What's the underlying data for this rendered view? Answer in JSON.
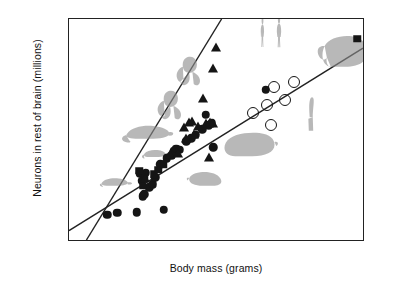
{
  "figure": {
    "domain": "chart",
    "background_color": "#ffffff",
    "marker_color": "#151515",
    "line_color": "#222222"
  },
  "chart_data": {
    "type": "scatter",
    "title": "",
    "xlabel": "Body mass (grams)",
    "ylabel": "Neurons in rest of brain (millions)",
    "xscale": "log",
    "yscale": "log",
    "xlim": [
      1,
      10000000
    ],
    "ylim": [
      2,
      1000
    ],
    "grid": false,
    "legend_position": "none",
    "xticks": [
      {
        "value": 1,
        "label": "1"
      },
      {
        "value": 10,
        "label": "10"
      },
      {
        "value": 100,
        "label": "100"
      },
      {
        "value": 1000,
        "label": "1,000"
      },
      {
        "value": 10000,
        "label": ""
      },
      {
        "value": 100000,
        "label": "100,000"
      },
      {
        "value": 1000000,
        "label": ""
      },
      {
        "value": 10000000,
        "label": "10,000,000"
      }
    ],
    "yticks": [
      {
        "value": 2,
        "label": "2"
      },
      {
        "value": 10,
        "label": "10"
      },
      {
        "value": 40,
        "label": "40"
      },
      {
        "value": 100,
        "label": "100"
      },
      {
        "value": 400,
        "label": "400"
      },
      {
        "value": 1000,
        "label": "1,000"
      }
    ],
    "series": [
      {
        "name": "Rodents (filled circles)",
        "marker": "circle",
        "filled": true,
        "points": [
          [
            8,
            4.3
          ],
          [
            14,
            4.5
          ],
          [
            40,
            4.6
          ],
          [
            47,
            13.5
          ],
          [
            52,
            11.0
          ],
          [
            55,
            7.2
          ],
          [
            60,
            7.6
          ],
          [
            66,
            13.8
          ],
          [
            78,
            9.2
          ],
          [
            95,
            10.0
          ],
          [
            110,
            12.2
          ],
          [
            145,
            17.5
          ],
          [
            175,
            4.9
          ],
          [
            205,
            20.5
          ],
          [
            260,
            22.0
          ],
          [
            300,
            25.5
          ],
          [
            340,
            27.0
          ],
          [
            420,
            26.0
          ],
          [
            600,
            33.0
          ],
          [
            780,
            36.0
          ],
          [
            1000,
            40.0
          ],
          [
            1400,
            46.0
          ],
          [
            1700,
            69.0
          ],
          [
            2000,
            52.0
          ],
          [
            2400,
            55.0
          ],
          [
            2600,
            28.0
          ],
          [
            45000,
            140.0
          ]
        ]
      },
      {
        "name": "Insectivores / other (filled squares)",
        "marker": "square",
        "filled": true,
        "points": [
          [
            46,
            14.5
          ],
          [
            56,
            9.6
          ],
          [
            62,
            12.0
          ],
          [
            100,
            13.2
          ],
          [
            130,
            15.0
          ],
          [
            170,
            17.5
          ],
          [
            6500000,
            580.0
          ]
        ]
      },
      {
        "name": "Primates (filled triangles)",
        "marker": "triangle",
        "filled": true,
        "points": [
          [
            62,
            12.8
          ],
          [
            250,
            25.0
          ],
          [
            380,
            26.0
          ],
          [
            520,
            54.0
          ],
          [
            600,
            40.0
          ],
          [
            700,
            62.0
          ],
          [
            820,
            64.0
          ],
          [
            900,
            44.0
          ],
          [
            1100,
            55.0
          ],
          [
            1500,
            120.0
          ],
          [
            1700,
            60.0
          ],
          [
            2000,
            23.0
          ],
          [
            2200,
            62.0
          ],
          [
            2500,
            60.0
          ],
          [
            2600,
            280.0
          ],
          [
            3000,
            500.0
          ]
        ]
      },
      {
        "name": "Artiodactyls (open circles)",
        "marker": "circle",
        "filled": false,
        "points": [
          [
            23000,
            72.0
          ],
          [
            48000,
            90.0
          ],
          [
            60000,
            52.0
          ],
          [
            72000,
            150.0
          ],
          [
            130000,
            105.0
          ],
          [
            210000,
            175.0
          ]
        ]
      }
    ],
    "trendlines": [
      {
        "name": "Non-primate (shallow) regression",
        "p1": [
          1,
          2.6
        ],
        "p2": [
          10000000,
          440.0
        ]
      },
      {
        "name": "Primate (steep) regression",
        "p1": [
          2.6,
          2.0
        ],
        "p2": [
          4300,
          1000.0
        ]
      }
    ],
    "annotations": [
      {
        "name": "human-figures",
        "label": "humans",
        "x": 62000,
        "y": 700
      },
      {
        "name": "elephant",
        "label": "elephant",
        "x": 3000000,
        "y": 420
      },
      {
        "name": "giraffe",
        "label": "giraffe",
        "x": 520000,
        "y": 70
      },
      {
        "name": "capybara",
        "label": "capybara",
        "x": 18000,
        "y": 31
      },
      {
        "name": "agouti",
        "label": "agouti",
        "x": 1700,
        "y": 12
      },
      {
        "name": "monkey-upper",
        "label": "monkey",
        "x": 700,
        "y": 250
      },
      {
        "name": "monkey-lower",
        "label": "monkey",
        "x": 250,
        "y": 95
      },
      {
        "name": "rat",
        "label": "rat",
        "x": 75,
        "y": 43
      },
      {
        "name": "mouse",
        "label": "mouse",
        "x": 13,
        "y": 11
      },
      {
        "name": "opossum",
        "label": "opossum",
        "x": 110,
        "y": 24
      }
    ]
  }
}
